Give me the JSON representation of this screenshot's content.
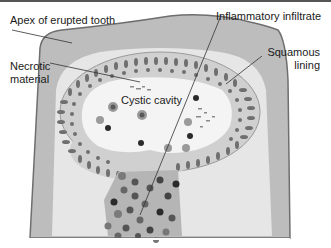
{
  "figure": {
    "type": "anatomical-diagram",
    "labels": {
      "apex": "Apex of erupted tooth",
      "infiltrate": "Inflammatory infiltrate",
      "necrotic_1": "Necrotic",
      "necrotic_2": "material",
      "squamous_1": "Squamous",
      "squamous_2": "lining",
      "cavity": "Cystic cavity"
    },
    "colors": {
      "background": "#ffffff",
      "tissue": "#bdbdbd",
      "tissue_outline": "#6e6e6e",
      "inner_tissue": "#e6e6e6",
      "cavity": "#f4f4f4",
      "lining_cells": "#6f6f6f",
      "dark_nuclei": "#2b2b2b",
      "infiltrate_block": "#a8a8a8",
      "leader_line": "#333333",
      "top_rule": "#555555"
    }
  }
}
